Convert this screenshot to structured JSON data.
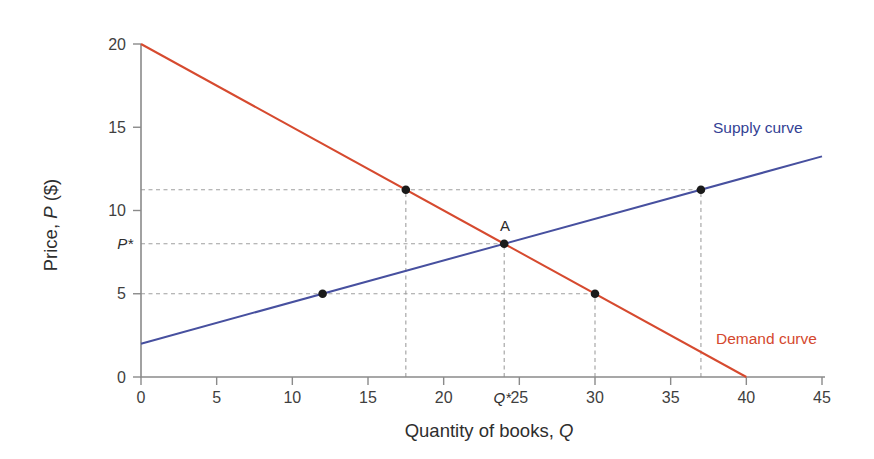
{
  "figure": {
    "xlabel": {
      "main": "Quantity of books, ",
      "var": "Q"
    },
    "ylabel": {
      "pre": "Price, ",
      "var": "P",
      "post": " ($)"
    },
    "equilibrium_point_label": "A",
    "p_star_label": "P*",
    "q_star_label": "Q*"
  },
  "chart_data": {
    "type": "line",
    "title": "",
    "xlabel": "Quantity of books, Q",
    "ylabel": "Price, P ($)",
    "xlim": [
      0,
      45
    ],
    "ylim": [
      0,
      20
    ],
    "xticks": [
      0,
      5,
      10,
      15,
      20,
      25,
      30,
      35,
      40,
      45
    ],
    "yticks": [
      0,
      5,
      10,
      15,
      20
    ],
    "grid": false,
    "series": [
      {
        "name": "Supply curve",
        "color": "#47509f",
        "label_color": "#333f94",
        "points": [
          [
            0,
            2
          ],
          [
            45,
            13.25
          ]
        ]
      },
      {
        "name": "Demand curve",
        "color": "#d64a2f",
        "label_color": "#d4482e",
        "points": [
          [
            0,
            20
          ],
          [
            40,
            0
          ]
        ]
      }
    ],
    "equilibrium": {
      "label": "A",
      "Q": 24,
      "P": 8,
      "q_axis_label": "Q*",
      "p_axis_label": "P*"
    },
    "markers": [
      {
        "Q": 12,
        "P": 5,
        "curve": "supply"
      },
      {
        "Q": 30,
        "P": 5,
        "curve": "demand"
      },
      {
        "Q": 17.5,
        "P": 11.25,
        "curve": "demand"
      },
      {
        "Q": 37,
        "P": 11.25,
        "curve": "supply"
      },
      {
        "Q": 24,
        "P": 8,
        "curve": "equilibrium"
      }
    ],
    "dashed_guides": {
      "horizontal": [
        {
          "P": 11.25,
          "to_Q": 37
        },
        {
          "P": 8,
          "to_Q": 24
        },
        {
          "P": 5,
          "to_Q": 30
        }
      ],
      "vertical": [
        {
          "Q": 17.5,
          "to_P": 11.25
        },
        {
          "Q": 24,
          "to_P": 8
        },
        {
          "Q": 30,
          "to_P": 5
        },
        {
          "Q": 37,
          "to_P": 11.25
        }
      ]
    },
    "colors": {
      "axis": "#8a8a8a",
      "tick_label": "#3f3f3f",
      "guide": "#a0a0a0",
      "marker": "#1a1a1a",
      "background": "#ffffff"
    }
  }
}
